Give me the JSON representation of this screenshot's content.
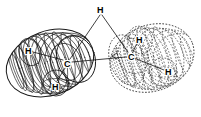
{
  "figure": {
    "kind": "molecular-wireframe-diagram",
    "width": 201,
    "height": 117,
    "background_color": "#ffffff",
    "line_color": "#1a1a1a",
    "label_color": "#000000",
    "caption": ""
  },
  "labels": [
    {
      "id": "h-top",
      "text": "H",
      "x": 97,
      "y": 6,
      "belongs_to": "shared-apex"
    },
    {
      "id": "h-left-upper",
      "text": "H",
      "x": 25,
      "y": 47,
      "belongs_to": "left-molecule"
    },
    {
      "id": "c-left",
      "text": "C",
      "x": 64,
      "y": 60,
      "belongs_to": "left-molecule"
    },
    {
      "id": "h-left-lower",
      "text": "H",
      "x": 52,
      "y": 83,
      "belongs_to": "left-molecule"
    },
    {
      "id": "h-right-upper",
      "text": "H",
      "x": 136,
      "y": 36,
      "belongs_to": "right-molecule"
    },
    {
      "id": "c-right",
      "text": "C",
      "x": 128,
      "y": 53,
      "belongs_to": "right-molecule"
    },
    {
      "id": "h-right-lower",
      "text": "H",
      "x": 165,
      "y": 68,
      "belongs_to": "right-molecule"
    }
  ],
  "bonds": [
    {
      "id": "bond-h-top-to-c-left",
      "from": "h-top",
      "to": "c-left",
      "style": "solid"
    },
    {
      "id": "bond-h-top-to-c-right",
      "from": "h-top",
      "to": "c-right",
      "style": "solid"
    },
    {
      "id": "bond-c-left-to-c-right",
      "from": "c-left",
      "to": "c-right",
      "style": "solid"
    },
    {
      "id": "bond-c-left-h-lower",
      "from": "c-left",
      "to": "h-left-lower",
      "style": "solid"
    },
    {
      "id": "bond-c-left-h-upper",
      "from": "c-left",
      "to": "h-left-upper",
      "style": "solid"
    },
    {
      "id": "bond-c-right-h-upper",
      "from": "c-right",
      "to": "h-right-upper",
      "style": "solid"
    },
    {
      "id": "bond-c-right-h-lower",
      "from": "c-right",
      "to": "h-right-lower",
      "style": "solid"
    }
  ],
  "surfaces": [
    {
      "id": "left-molecule",
      "name": "left-wireframe-ovoid",
      "line_style": "solid",
      "description": "solid-line mesh ovoid capsule, tilted, left of figure"
    },
    {
      "id": "right-molecule",
      "name": "right-wireframe-ovoid",
      "line_style": "dashed",
      "description": "dashed-line mesh ovoid capsule, tilted, right of figure"
    }
  ]
}
